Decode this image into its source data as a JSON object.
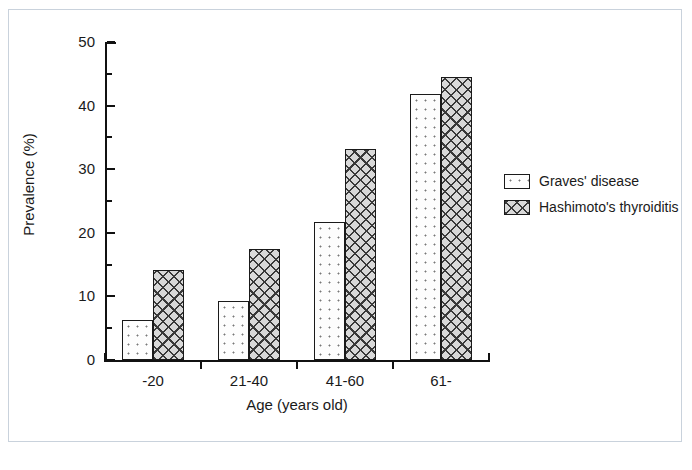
{
  "chart_data": {
    "type": "bar",
    "title": "",
    "subtitle": "",
    "xlabel": "Age (years old)",
    "ylabel": "Prevalence (%)",
    "categories": [
      "-20",
      "21-40",
      "41-60",
      "61-"
    ],
    "series": [
      {
        "name": "Graves' disease",
        "pattern": "dotted",
        "values": [
          6.3,
          9.3,
          21.7,
          41.8
        ]
      },
      {
        "name": "Hashimoto's thyroiditis",
        "pattern": "cross-hatch",
        "values": [
          14.2,
          17.4,
          33.1,
          44.5
        ]
      }
    ],
    "ylim": [
      0,
      50
    ],
    "y_ticks_major": [
      0,
      10,
      20,
      30,
      40,
      50
    ],
    "y_ticks_minor": [
      5,
      15,
      25,
      35,
      45
    ],
    "y_tick_labels": [
      "0",
      "10",
      "20",
      "30",
      "40",
      "50"
    ],
    "grid": false,
    "legend_position": "right"
  },
  "axis": {
    "y_label": "Prevalence (%)",
    "x_label": "Age (years old)",
    "y_tick_labels": [
      "50",
      "40",
      "30",
      "20",
      "10",
      "0"
    ],
    "x_tick_labels": [
      "-20",
      "21-40",
      "41-60",
      "61-"
    ]
  },
  "legend": {
    "entries": [
      {
        "label": "Graves' disease"
      },
      {
        "label": "Hashimoto's thyroiditis"
      }
    ]
  },
  "colors": {
    "axis": "#111111",
    "text": "#1a1a1a",
    "frame_border": "#c9d2dc",
    "background": "#ffffff",
    "series_1_fill": "#fdfdfd",
    "series_2_fill": "#d9d9d9"
  }
}
